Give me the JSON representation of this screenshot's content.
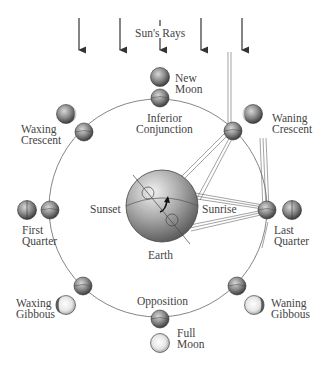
{
  "labels": {
    "sun_rays": "Sun's Rays",
    "new_moon": [
      "New",
      "Moon"
    ],
    "inferior_conjunction": [
      "Inferior",
      "Conjunction"
    ],
    "waning_crescent": [
      "Waning",
      "Crescent"
    ],
    "waxing_crescent": [
      "Waxing",
      "Crescent"
    ],
    "sunset": "Sunset",
    "sunrise": "Sunrise",
    "earth": "Earth",
    "first_quarter": [
      "First",
      "Quarter"
    ],
    "last_quarter": [
      "Last",
      "Quarter"
    ],
    "waxing_gibbous": [
      "Waxing",
      "Gibbous"
    ],
    "waning_gibbous": [
      "Waning",
      "Gibbous"
    ],
    "opposition": "Opposition",
    "full_moon": [
      "Full",
      "Moon"
    ]
  },
  "colors": {
    "line": "#555555",
    "moon_dark": "#5a5a5a",
    "moon_light": "#f2f2f2",
    "text": "#444444"
  }
}
